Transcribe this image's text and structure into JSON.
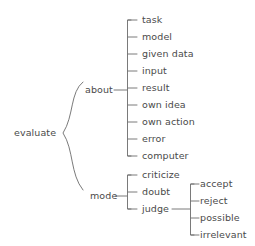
{
  "diagram": {
    "type": "tree",
    "orientation": "left-to-right",
    "root": {
      "label": "evaluate",
      "x": 14,
      "y": 133
    },
    "branches": [
      {
        "label": "about",
        "x": 85,
        "y": 90,
        "children": [
          {
            "label": "task",
            "x": 142,
            "y": 24
          },
          {
            "label": "model",
            "x": 142,
            "y": 41
          },
          {
            "label": "given data",
            "x": 142,
            "y": 58
          },
          {
            "label": "input",
            "x": 142,
            "y": 75
          },
          {
            "label": "result",
            "x": 142,
            "y": 92
          },
          {
            "label": "own idea",
            "x": 142,
            "y": 109
          },
          {
            "label": "own action",
            "x": 142,
            "y": 126
          },
          {
            "label": "error",
            "x": 142,
            "y": 143
          },
          {
            "label": "computer",
            "x": 142,
            "y": 160
          }
        ]
      },
      {
        "label": "mode",
        "x": 90,
        "y": 196,
        "children": [
          {
            "label": "criticize",
            "x": 142,
            "y": 179
          },
          {
            "label": "doubt",
            "x": 142,
            "y": 196
          },
          {
            "label": "judge",
            "x": 142,
            "y": 213,
            "children": [
              {
                "label": "accept",
                "x": 200,
                "y": 188
              },
              {
                "label": "reject",
                "x": 200,
                "y": 205
              },
              {
                "label": "possible",
                "x": 200,
                "y": 222
              },
              {
                "label": "irrelevant",
                "x": 200,
                "y": 239
              }
            ]
          }
        ]
      }
    ],
    "colors": {
      "text": "#4a4a4a",
      "line": "#6b6b6b",
      "background": "#ffffff"
    }
  }
}
